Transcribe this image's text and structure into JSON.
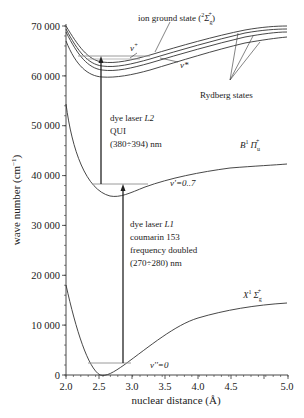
{
  "chart_data": {
    "type": "line",
    "title": "",
    "xlabel": "nuclear distance (Å)",
    "ylabel": "wave number (cm⁻¹)",
    "xlim": [
      2.0,
      5.0
    ],
    "ylim": [
      0,
      70000
    ],
    "x_ticks": [
      "2.0",
      "2.5",
      "3.0",
      "3.5",
      "4.0",
      "4.5",
      "5.0"
    ],
    "y_ticks": [
      "0",
      "10 000",
      "20 000",
      "30 000",
      "40 000",
      "50 000",
      "60 000",
      "70 000"
    ],
    "grid": false,
    "series": [
      {
        "name": "X¹Σg⁺",
        "x": [
          2.0,
          2.25,
          2.5,
          2.75,
          3.0,
          3.5,
          4.0,
          4.5,
          5.0
        ],
        "y": [
          18000,
          5000,
          0,
          1200,
          3800,
          8200,
          11000,
          12600,
          13400
        ]
      },
      {
        "name": "B¹Πu⁺",
        "x": [
          2.0,
          2.25,
          2.5,
          2.75,
          3.0,
          3.5,
          4.0,
          4.5,
          5.0
        ],
        "y": [
          54500,
          40500,
          35800,
          36300,
          38500,
          41000,
          42500,
          43300,
          43700
        ]
      },
      {
        "name": "ion ground state (²Σg⁺)",
        "x": [
          2.0,
          2.25,
          2.5,
          2.75,
          3.0,
          3.5,
          4.0,
          4.5,
          5.0
        ],
        "y": [
          70000,
          63800,
          62600,
          63000,
          64200,
          66600,
          68200,
          69300,
          70000
        ]
      },
      {
        "name": "Rydberg state 1",
        "x": [
          2.0,
          2.25,
          2.5,
          2.75,
          3.0,
          3.5,
          4.0,
          4.5,
          5.0
        ],
        "y": [
          69500,
          63000,
          61800,
          62200,
          63400,
          65800,
          67500,
          68600,
          69400
        ]
      },
      {
        "name": "Rydberg state 2",
        "x": [
          2.0,
          2.25,
          2.5,
          2.75,
          3.0,
          3.5,
          4.0,
          4.5,
          5.0
        ],
        "y": [
          69000,
          62200,
          61000,
          61400,
          62600,
          65000,
          66800,
          68000,
          68800
        ]
      },
      {
        "name": "Rydberg state 3",
        "x": [
          2.0,
          2.25,
          2.5,
          2.75,
          3.0,
          3.5,
          4.0,
          4.5,
          5.0
        ],
        "y": [
          67000,
          60800,
          59600,
          60000,
          61200,
          63600,
          65400,
          66600,
          67400
        ]
      }
    ],
    "levels": [
      {
        "name": "v''=0",
        "y": 2400,
        "x_range": [
          2.33,
          2.97
        ]
      },
      {
        "name": "v'=0..7",
        "y": 38200,
        "x_range": [
          2.39,
          3.25
        ]
      },
      {
        "name": "v⁺ / v*",
        "y": 63800,
        "x_range": [
          2.18,
          3.27
        ]
      }
    ],
    "transitions": [
      {
        "name": "dye laser L1",
        "x": 2.86,
        "from": 2400,
        "to": 38200
      },
      {
        "name": "dye laser L2",
        "x": 2.53,
        "from": 38200,
        "to": 63800
      }
    ],
    "annotations": [
      "ion ground state (²Σg⁺)",
      "v⁺",
      "v*",
      "Rydberg states",
      "dye laser L2",
      "QUI",
      "(380÷394) nm",
      "B¹Πu⁺",
      "v'=0..7",
      "dye laser L1",
      "coumarin 153",
      "frequency doubled",
      "(270÷280) nm",
      "X¹Σg⁺",
      "v''=0"
    ]
  },
  "axes": {
    "x_title": "nuclear distance (Å)",
    "y_title": "wave number (cm",
    "y_title_sup": "−1",
    "y_title_close": ")",
    "x_ticks": [
      "2.0",
      "2.5",
      "3.0",
      "3.5",
      "4.0",
      "4.5",
      "5.0"
    ],
    "y_ticks": [
      "0",
      "10 000",
      "20 000",
      "30 000",
      "40 000",
      "50 000",
      "60 000",
      "70 000"
    ]
  },
  "labels": {
    "ion_state": "ion ground state (",
    "ion_state_sup": "2",
    "ion_state_sym": "Σ",
    "ion_state_sub": "g",
    "ion_state_plus": "+",
    "ion_state_close": ")",
    "v_plus": "v",
    "v_plus_sup": "+",
    "v_star": "v*",
    "rydberg": "Rydberg states",
    "l2_line1": "dye laser ",
    "l2_line1_it": "L2",
    "l2_line2": "QUI",
    "l2_line3": "(380÷394) nm",
    "b_state_letter": "B",
    "b_state_sup": "1",
    "b_state_sym": "Π",
    "b_state_sub": "u",
    "b_state_plus": "+",
    "v_prime": "v'=0..7",
    "l1_line1": "dye laser ",
    "l1_line1_it": "L1",
    "l1_line2": "coumarin 153",
    "l1_line3": "frequency doubled",
    "l1_line4": "(270÷280) nm",
    "x_state_letter": "X",
    "x_state_sup": "1",
    "x_state_sym": "Σ",
    "x_state_sub": "g",
    "x_state_plus": "+",
    "v_dprime": "v''=0"
  },
  "colors": {
    "curve": "#333333",
    "level": "#9a9a9a",
    "arrow": "#222222",
    "text": "#222222"
  }
}
